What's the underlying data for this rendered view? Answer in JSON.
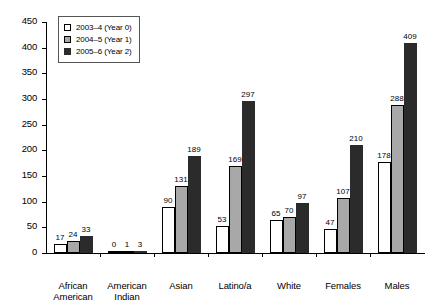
{
  "chart_data": {
    "type": "bar",
    "title": "",
    "xlabel": "",
    "ylabel": "",
    "ylim": [
      0,
      450
    ],
    "ytick_step": 50,
    "yticks": [
      0,
      50,
      100,
      150,
      200,
      250,
      300,
      350,
      400,
      450
    ],
    "grid": false,
    "legend_position": "top-left-inside",
    "categories": [
      "African\nAmerican",
      "American\nIndian",
      "Asian",
      "Latino/a",
      "White",
      "Females",
      "Males"
    ],
    "series": [
      {
        "name": "2003–4 (Year 0)",
        "color": "#ffffff",
        "values": [
          17,
          0,
          90,
          53,
          65,
          47,
          178
        ]
      },
      {
        "name": "2004–5 (Year 1)",
        "color": "#a8a8a8",
        "values": [
          24,
          1,
          131,
          169,
          70,
          107,
          288
        ]
      },
      {
        "name": "2005–6 (Year 2)",
        "color": "#2b2b2b",
        "values": [
          33,
          3,
          189,
          297,
          97,
          210,
          409
        ]
      }
    ]
  }
}
